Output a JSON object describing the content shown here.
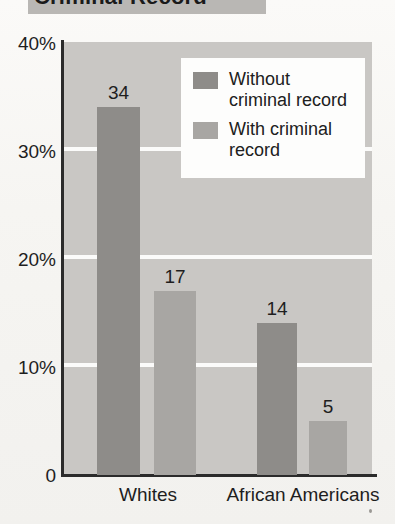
{
  "title": {
    "text": "Criminal Record",
    "clipped": true
  },
  "legend": {
    "position": "top-right",
    "entries": [
      {
        "label": "Without\ncriminal record",
        "swatch": "dark",
        "color": "#8e8c89"
      },
      {
        "label": "With criminal\nrecord",
        "swatch": "light",
        "color": "#a8a6a3"
      }
    ]
  },
  "axes": {
    "y_ticks": [
      "40%",
      "30%",
      "20%",
      "10%",
      "0"
    ],
    "x_categories": [
      "Whites",
      "African Americans"
    ]
  },
  "colors": {
    "plot_background": "#c9c7c4",
    "gridline": "#fbfbfa",
    "axis": "#2b2b2b",
    "bar_dark": "#8e8c89",
    "bar_light": "#a8a6a3",
    "page": "#f7f6f4",
    "title_banner": "#b9b7b4",
    "legend_background": "#fdfdfc"
  },
  "chart_data": {
    "type": "bar",
    "title": "Criminal Record",
    "xlabel": "",
    "ylabel": "",
    "ylim": [
      0,
      40
    ],
    "yunit": "%",
    "grid": true,
    "legend_position": "top-right",
    "categories": [
      "Whites",
      "African Americans"
    ],
    "series": [
      {
        "name": "Without criminal record",
        "values": [
          34,
          14
        ],
        "color": "#8e8c89"
      },
      {
        "name": "With criminal record",
        "values": [
          17,
          5
        ],
        "color": "#a8a6a3"
      }
    ],
    "tick_labels": [
      "40%",
      "30%",
      "20%",
      "10%",
      "0"
    ],
    "tick_values": [
      40,
      30,
      20,
      10,
      0
    ],
    "data_labels": [
      "34",
      "17",
      "14",
      "5"
    ]
  },
  "bar_geometry": [
    {
      "label": "34",
      "series": 0,
      "category": 0,
      "left": 97,
      "width": 43,
      "value": 34
    },
    {
      "label": "17",
      "series": 1,
      "category": 0,
      "left": 154,
      "width": 42,
      "value": 17
    },
    {
      "label": "14",
      "series": 0,
      "category": 1,
      "left": 257,
      "width": 40,
      "value": 14
    },
    {
      "label": "5",
      "series": 1,
      "category": 1,
      "left": 309,
      "width": 38,
      "value": 5
    }
  ],
  "category_positions": [
    {
      "label": "Whites",
      "left": 83,
      "width": 130
    },
    {
      "label": "African Americans",
      "left": 213,
      "width": 180
    }
  ]
}
